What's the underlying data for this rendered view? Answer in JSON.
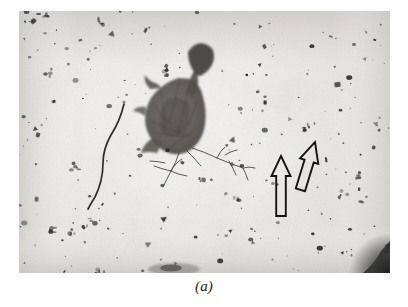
{
  "figure": {
    "caption": "(a)",
    "kind": "electron-micrograph",
    "frame": {
      "x": 19,
      "y": 11,
      "width": 371,
      "height": 262
    },
    "background": {
      "base_color": "#e9e8e4",
      "light_color": "#f4f3f1",
      "edge_shade_color": "#cfcdc8",
      "grain_color": "#bdbbb5"
    },
    "ink_color": "#1a1a1a",
    "particle_color": "#2b2b2b"
  },
  "annotations": {
    "arrows": [
      {
        "name": "arrow-left",
        "label": "pointer-arrow-vertical",
        "tip_x": 281,
        "tip_y": 156,
        "tail_x": 281,
        "tail_y": 216,
        "rotation_deg": 0,
        "style": "hollow-outline",
        "stroke": "#141414"
      },
      {
        "name": "arrow-right",
        "label": "pointer-arrow-tilted",
        "tip_x": 315,
        "tip_y": 142,
        "tail_x": 330,
        "tail_y": 192,
        "rotation_deg": 17,
        "style": "hollow-outline",
        "stroke": "#141414"
      }
    ],
    "features": [
      {
        "name": "large-flake-particle",
        "description": "large crumpled leaf-like flake with branching fibril tails",
        "center_x": 190,
        "center_y": 112
      },
      {
        "name": "curved-fiber",
        "description": "long thin curved fibre",
        "start_x": 124,
        "start_y": 104,
        "end_x": 88,
        "end_y": 209
      },
      {
        "name": "dark-corner-wedge",
        "description": "dark wedge at lower right corner of the print",
        "center_x": 382,
        "center_y": 262
      }
    ]
  },
  "speckles": {
    "count_hint": 230,
    "seed": 20240517
  }
}
